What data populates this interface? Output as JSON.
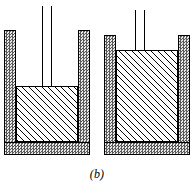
{
  "figure": {
    "caption": "(b)",
    "colors": {
      "wall_fill": "#a8a8a8",
      "wall_stipple_dark": "#5a5a5a",
      "wall_stipple_light": "#e8e8e8",
      "outline": "#000000",
      "background": "#ffffff",
      "hatch_line": "#000000"
    }
  },
  "vessels": [
    {
      "id": "left",
      "name": "left-cylinder",
      "state_label": "piston-raised",
      "rod": {
        "name": "piston-rod-left",
        "extends_above_cylinder": true,
        "top_y_px": 6,
        "bottom_y_px": 86,
        "width_px": 10
      },
      "fill": {
        "name": "hatched-material-left",
        "pattern": "diagonal-hatch-45",
        "top_y_px": 86,
        "bottom_y_px": 142,
        "fraction_of_interior": 0.52
      },
      "headspace": {
        "name": "headspace-left",
        "present": true,
        "top_y_px": 32,
        "bottom_y_px": 86
      },
      "geometry": {
        "outer_left_px": 4,
        "outer_right_px": 90,
        "outer_top_px": 30,
        "outer_bottom_px": 155,
        "wall_thickness_px": 12,
        "base_thickness_px": 13
      }
    },
    {
      "id": "right",
      "name": "right-cylinder",
      "state_label": "piston-lowered",
      "rod": {
        "name": "piston-rod-right",
        "extends_above_cylinder": true,
        "top_y_px": 10,
        "bottom_y_px": 48,
        "width_px": 10
      },
      "fill": {
        "name": "hatched-material-right",
        "pattern": "diagonal-hatch-45",
        "top_y_px": 50,
        "bottom_y_px": 142,
        "fraction_of_interior": 0.96
      },
      "headspace": {
        "name": "headspace-right",
        "present": false,
        "top_y_px": 0,
        "bottom_y_px": 0
      },
      "geometry": {
        "outer_left_px": 104,
        "outer_right_px": 190,
        "outer_top_px": 35,
        "outer_bottom_px": 155,
        "wall_thickness_px": 12,
        "base_thickness_px": 13
      }
    }
  ]
}
